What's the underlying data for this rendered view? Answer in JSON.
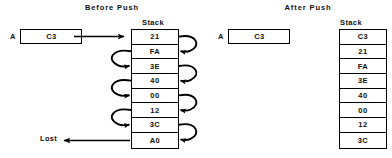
{
  "diagram": {
    "title_before": "Before  Push",
    "title_after": "After  Push",
    "stack_label_left": "Stack",
    "stack_label_right": "Stack",
    "lost_label": "Lost",
    "ink_color": "#000000",
    "background_color": "#ffffff"
  },
  "before": {
    "register": {
      "name": "A",
      "value": "C3"
    },
    "stack": [
      "21",
      "FA",
      "3E",
      "40",
      "00",
      "12",
      "3C",
      "A0"
    ],
    "shift_arrow_count_left": 3,
    "shift_arrow_count_right": 4,
    "push_arrow": "A-to-stack-top",
    "lost_value": "A0"
  },
  "after": {
    "register": {
      "name": "A",
      "value": "C3"
    },
    "stack": [
      "C3",
      "21",
      "FA",
      "3E",
      "40",
      "00",
      "12",
      "3C"
    ]
  }
}
